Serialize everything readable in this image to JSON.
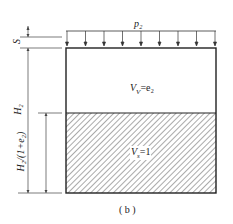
{
  "diagram": {
    "load_label": "p₂",
    "settlement_label": "S",
    "height_label": "H₂",
    "solid_height_label": "H₂/(1+e₂)",
    "void_label": "V_V=e₂",
    "void_label_text": "V",
    "void_label_sub": "V",
    "void_label_eq": "=e₂",
    "solid_label_text": "V",
    "solid_label_sub": "s",
    "solid_label_eq": "=1",
    "caption": "( b )",
    "load_arrow_count": 9
  }
}
